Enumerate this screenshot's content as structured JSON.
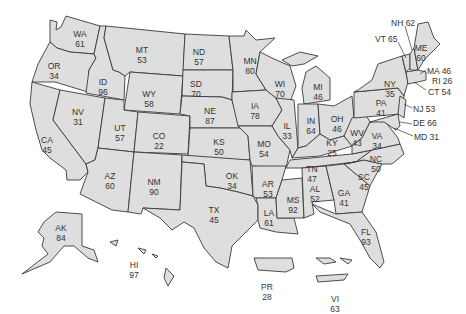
{
  "map": {
    "type": "choropleth-like US state map with numeric labels",
    "fill_color": "#dedede",
    "border_color": "#3a3a3a",
    "states": [
      {
        "code": "WA",
        "value": "61",
        "x": 80,
        "y": 30
      },
      {
        "code": "OR",
        "value": "34",
        "x": 54,
        "y": 62
      },
      {
        "code": "CA",
        "value": "45",
        "x": 47,
        "y": 136
      },
      {
        "code": "ID",
        "value": "96",
        "x": 103,
        "y": 78
      },
      {
        "code": "NV",
        "value": "31",
        "x": 78,
        "y": 108
      },
      {
        "code": "MT",
        "value": "53",
        "x": 142,
        "y": 46
      },
      {
        "code": "WY",
        "value": "58",
        "x": 149,
        "y": 90
      },
      {
        "code": "UT",
        "value": "57",
        "x": 120,
        "y": 124
      },
      {
        "code": "AZ",
        "value": "60",
        "x": 110,
        "y": 172
      },
      {
        "code": "CO",
        "value": "22",
        "x": 159,
        "y": 132
      },
      {
        "code": "NM",
        "value": "90",
        "x": 154,
        "y": 178
      },
      {
        "code": "ND",
        "value": "57",
        "x": 199,
        "y": 48
      },
      {
        "code": "SD",
        "value": "70",
        "x": 196,
        "y": 80
      },
      {
        "code": "NE",
        "value": "87",
        "x": 210,
        "y": 107
      },
      {
        "code": "KS",
        "value": "50",
        "x": 219,
        "y": 138
      },
      {
        "code": "OK",
        "value": "34",
        "x": 232,
        "y": 172
      },
      {
        "code": "TX",
        "value": "45",
        "x": 214,
        "y": 206
      },
      {
        "code": "MN",
        "value": "80",
        "x": 250,
        "y": 57
      },
      {
        "code": "IA",
        "value": "78",
        "x": 255,
        "y": 102
      },
      {
        "code": "MO",
        "value": "54",
        "x": 264,
        "y": 140
      },
      {
        "code": "AR",
        "value": "53",
        "x": 268,
        "y": 180
      },
      {
        "code": "LA",
        "value": "61",
        "x": 269,
        "y": 209
      },
      {
        "code": "WI",
        "value": "70",
        "x": 280,
        "y": 80
      },
      {
        "code": "IL",
        "value": "33",
        "x": 287,
        "y": 122
      },
      {
        "code": "MS",
        "value": "92",
        "x": 293,
        "y": 196
      },
      {
        "code": "MI",
        "value": "46",
        "x": 318,
        "y": 83
      },
      {
        "code": "IN",
        "value": "64",
        "x": 311,
        "y": 117
      },
      {
        "code": "OH",
        "value": "46",
        "x": 337,
        "y": 115
      },
      {
        "code": "KY",
        "value": "25",
        "x": 332,
        "y": 139
      },
      {
        "code": "TN",
        "value": "47",
        "x": 312,
        "y": 165
      },
      {
        "code": "AL",
        "value": "52",
        "x": 315,
        "y": 185
      },
      {
        "code": "GA",
        "value": "41",
        "x": 344,
        "y": 189
      },
      {
        "code": "FL",
        "value": "93",
        "x": 366,
        "y": 228
      },
      {
        "code": "SC",
        "value": "45",
        "x": 364,
        "y": 173
      },
      {
        "code": "NC",
        "value": "50",
        "x": 376,
        "y": 155
      },
      {
        "code": "WV",
        "value": "43",
        "x": 357,
        "y": 129
      },
      {
        "code": "VA",
        "value": "34",
        "x": 377,
        "y": 132
      },
      {
        "code": "PA",
        "value": "41",
        "x": 381,
        "y": 99
      },
      {
        "code": "NY",
        "value": "35",
        "x": 390,
        "y": 80
      },
      {
        "code": "ME",
        "value": "60",
        "x": 421,
        "y": 44
      },
      {
        "code": "AK",
        "value": "84",
        "x": 61,
        "y": 224
      },
      {
        "code": "HI",
        "value": "97",
        "x": 134,
        "y": 261
      },
      {
        "code": "PR",
        "value": "28",
        "x": 267,
        "y": 283
      },
      {
        "code": "VI",
        "value": "63",
        "x": 335,
        "y": 295
      }
    ],
    "callouts": [
      {
        "code": "NH",
        "value": "62",
        "text": "NH 62",
        "x": 391,
        "y": 19
      },
      {
        "code": "VT",
        "value": "65",
        "text": "VT 65",
        "x": 375,
        "y": 35
      },
      {
        "code": "MA",
        "value": "46",
        "text": "MA 46",
        "x": 427,
        "y": 67
      },
      {
        "code": "RI",
        "value": "26",
        "text": "RI 26",
        "x": 432,
        "y": 77
      },
      {
        "code": "CT",
        "value": "54",
        "text": "CT 54",
        "x": 428,
        "y": 88
      },
      {
        "code": "NJ",
        "value": "53",
        "text": "NJ 53",
        "x": 413,
        "y": 105
      },
      {
        "code": "DE",
        "value": "66",
        "text": "DE 66",
        "x": 413,
        "y": 119
      },
      {
        "code": "MD",
        "value": "31",
        "text": "MD 31",
        "x": 414,
        "y": 133
      }
    ]
  }
}
